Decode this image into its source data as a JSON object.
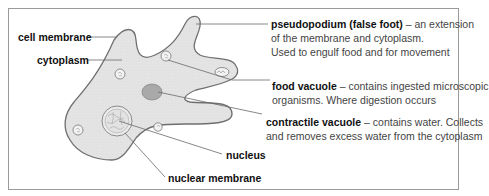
{
  "labels": {
    "cell_membrane": "cell membrane",
    "cytoplasm": "cytoplasm",
    "nucleus": "nucleus",
    "nuclear_membrane": "nuclear membrane"
  },
  "annotations": {
    "pseudopodium": {
      "term": "pseudopodium (false foot)",
      "line1": " – an extension",
      "line2": "of the membrane and cytoplasm.",
      "line3": "Used to engulf food and for movement"
    },
    "food_vacuole": {
      "term": "food vacuole",
      "line1": " – contains ingested microscopic",
      "line2": "organisms. Where digestion occurs"
    },
    "contractile_vacuole": {
      "term": "contractile vacuole",
      "line1": " – contains water. Collects",
      "line2": "and removes excess water from the cytoplasm"
    }
  },
  "colors": {
    "cell_fill": "#e6e6e6",
    "cell_outline": "#6f6f6f",
    "vacuole_fill": "#a9a9a9",
    "leader_line": "#6a6a6a",
    "frame": "#9a9a9a"
  }
}
